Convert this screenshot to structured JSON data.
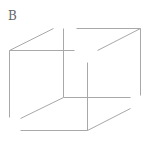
{
  "figure": {
    "panel_label": "B",
    "stroke_color": "#a8a8a8",
    "label_color": "#666666",
    "edges": [
      {
        "id": "front-left-vertical",
        "x1": 9,
        "y1": 50,
        "x2": 9,
        "y2": 117
      },
      {
        "id": "front-top",
        "x1": 9,
        "y1": 50,
        "x2": 74,
        "y2": 50
      },
      {
        "id": "top-left-diagonal",
        "x1": 9,
        "y1": 50,
        "x2": 53,
        "y2": 28
      },
      {
        "id": "back-left-vertical",
        "x1": 63,
        "y1": 28,
        "x2": 63,
        "y2": 97
      },
      {
        "id": "back-top",
        "x1": 76,
        "y1": 28,
        "x2": 140,
        "y2": 28
      },
      {
        "id": "top-right-diagonal",
        "x1": 97,
        "y1": 50,
        "x2": 140,
        "y2": 28
      },
      {
        "id": "back-right-vertical",
        "x1": 140,
        "y1": 28,
        "x2": 140,
        "y2": 95
      },
      {
        "id": "back-bottom",
        "x1": 63,
        "y1": 97,
        "x2": 130,
        "y2": 97
      },
      {
        "id": "bottom-left-diagonal",
        "x1": 20,
        "y1": 118,
        "x2": 63,
        "y2": 97
      },
      {
        "id": "front-right-vertical",
        "x1": 87,
        "y1": 62,
        "x2": 87,
        "y2": 130
      },
      {
        "id": "front-bottom",
        "x1": 20,
        "y1": 130,
        "x2": 87,
        "y2": 130
      },
      {
        "id": "bottom-right-diagonal",
        "x1": 87,
        "y1": 130,
        "x2": 130,
        "y2": 108
      }
    ]
  }
}
